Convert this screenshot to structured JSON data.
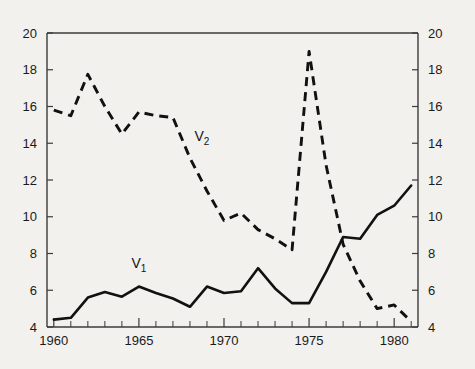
{
  "chart_data": {
    "type": "line",
    "title": "",
    "subtitle": "",
    "xlabel": "",
    "ylabel": "",
    "xlim": [
      1959.6,
      1981.4
    ],
    "ylim": [
      4,
      20
    ],
    "grid": false,
    "legend_position": "inline-annotation",
    "x_tick_labels": [
      "1960",
      "1965",
      "1970",
      "1975",
      "1980"
    ],
    "x_tick_values": [
      1960,
      1965,
      1970,
      1975,
      1980
    ],
    "x_minor_tick_step": 1,
    "y_tick_labels_left": [
      "20",
      "18",
      "16",
      "14",
      "12",
      "10",
      "8",
      "6",
      "4"
    ],
    "y_tick_labels_right": [
      "20",
      "18",
      "16",
      "14",
      "12",
      "10",
      "8",
      "6",
      "4"
    ],
    "y_tick_values": [
      20,
      18,
      16,
      14,
      12,
      10,
      8,
      6,
      4
    ],
    "x": [
      1960,
      1961,
      1962,
      1963,
      1964,
      1965,
      1966,
      1967,
      1968,
      1969,
      1970,
      1971,
      1972,
      1973,
      1974,
      1975,
      1976,
      1977,
      1978,
      1979,
      1980,
      1981
    ],
    "series": [
      {
        "name": "V1",
        "label": "V",
        "subscript": "1",
        "style": "solid",
        "color": "#111111",
        "annotation_x": 1965,
        "annotation_y": 7.2,
        "values": [
          4.4,
          4.5,
          5.6,
          5.9,
          5.65,
          6.2,
          5.85,
          5.55,
          5.1,
          6.2,
          5.85,
          5.95,
          7.2,
          6.1,
          5.3,
          5.3,
          7.0,
          8.9,
          8.8,
          10.1,
          10.6,
          11.7
        ]
      },
      {
        "name": "V2",
        "label": "V",
        "subscript": "2",
        "style": "dashed",
        "color": "#111111",
        "annotation_x": 1968.7,
        "annotation_y": 14.1,
        "values": [
          15.8,
          15.5,
          17.75,
          16.0,
          14.5,
          15.7,
          15.5,
          15.4,
          13.2,
          11.4,
          9.8,
          10.2,
          9.3,
          8.8,
          8.2,
          19.0,
          12.8,
          8.5,
          6.5,
          5.0,
          5.2,
          4.3
        ]
      }
    ]
  },
  "axes_geometry": {
    "plot_left_px": 47,
    "plot_right_px": 418,
    "plot_top_px": 33,
    "plot_bottom_px": 327
  }
}
